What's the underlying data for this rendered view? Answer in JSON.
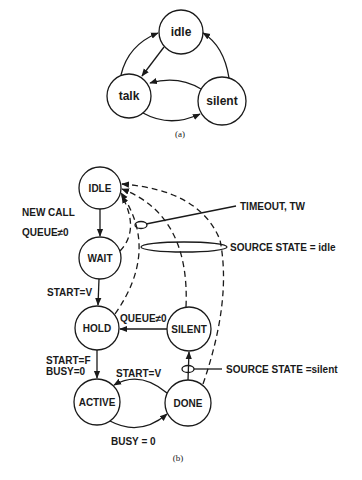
{
  "figure_a": {
    "states": [
      "idle",
      "talk",
      "silent"
    ],
    "caption": "(a)"
  },
  "figure_b": {
    "states": {
      "idle": "IDLE",
      "wait": "WAIT",
      "hold": "HOLD",
      "silent": "SILENT",
      "active": "ACTIVE",
      "done": "DONE"
    },
    "labels": {
      "new_call": "NEW CALL",
      "queue_ne0_left": "QUEUE≠0",
      "start_v_1": "START=V",
      "queue_ne0_mid": "QUEUE≠0",
      "start_f": "START=F",
      "busy0_left": "BUSY=0",
      "start_v_2": "START=V",
      "busy0_bottom": "BUSY = 0",
      "timeout": "TIMEOUT, TW",
      "source_idle": "SOURCE  STATE = idle",
      "source_silent": "SOURCE  STATE =silent"
    },
    "caption": "(b)"
  },
  "colors": {
    "ink": "#1a1a1a",
    "background": "#ffffff"
  }
}
